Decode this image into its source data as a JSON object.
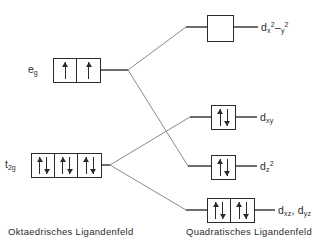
{
  "diagram": {
    "line_color": "#6b6b6b",
    "box_color": "#2b2b2b",
    "text_color": "#2b2b2b"
  },
  "captions": {
    "left": "Oktaedrisches Ligandenfeld",
    "right": "Quadratisches Ligandenfeld"
  },
  "octahedral": {
    "levels": [
      {
        "id": "eg",
        "label_main": "e",
        "label_sub": "g",
        "cells": [
          {
            "electrons": [
              "up"
            ]
          },
          {
            "electrons": [
              "up"
            ]
          }
        ],
        "box_x": 53,
        "box_y": 58,
        "cell_count": 2
      },
      {
        "id": "t2g",
        "label_main": "t",
        "label_sub": "2g",
        "cells": [
          {
            "electrons": [
              "up",
              "down"
            ]
          },
          {
            "electrons": [
              "up",
              "down"
            ]
          },
          {
            "electrons": [
              "up",
              "down"
            ]
          }
        ],
        "box_x": 31,
        "box_y": 153,
        "cell_count": 3
      }
    ]
  },
  "square_planar": {
    "levels": [
      {
        "id": "dx2-y2",
        "label_parts": {
          "d": "d",
          "sub1": "x",
          "sup1": "2",
          "sep": "–",
          "sub2": "y",
          "sup2": "2"
        },
        "label_text": "d x2 - y2",
        "cells": [
          {
            "electrons": []
          }
        ],
        "box_x": 207,
        "box_y": 15,
        "cell_count": 1
      },
      {
        "id": "dxy",
        "label_parts": {
          "d": "d",
          "sub1": "xy"
        },
        "label_text": "d xy",
        "cells": [
          {
            "electrons": [
              "up",
              "down"
            ]
          }
        ],
        "box_x": 211,
        "box_y": 105,
        "cell_count": 1
      },
      {
        "id": "dz2",
        "label_parts": {
          "d": "d",
          "sub1": "z",
          "sup1": "2"
        },
        "label_text": "d z2",
        "cells": [
          {
            "electrons": [
              "up",
              "down"
            ]
          }
        ],
        "box_x": 211,
        "box_y": 155,
        "cell_count": 1
      },
      {
        "id": "dxz-dyz",
        "label_parts": {
          "d": "d",
          "sub1": "xz",
          "sep": ", ",
          "d2": "d",
          "sub2": "yz"
        },
        "label_text": "d xz , d yz",
        "cells": [
          {
            "electrons": [
              "up",
              "down"
            ]
          },
          {
            "electrons": [
              "up",
              "down"
            ]
          }
        ],
        "box_x": 207,
        "box_y": 198,
        "cell_count": 2
      }
    ]
  }
}
